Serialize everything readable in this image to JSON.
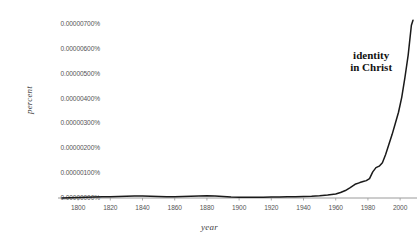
{
  "chart_data": {
    "type": "line",
    "title": "",
    "xlabel": "year",
    "ylabel": "percent",
    "xlim": [
      1790,
      2008
    ],
    "ylim": [
      0,
      7.2e-06
    ],
    "grid": false,
    "legend": null,
    "annotations": [
      {
        "text_line1": "identity",
        "text_line2": "in Christ",
        "x": 1982,
        "y": 5.6e-06
      }
    ],
    "y_tick_labels": [
      "0.00000700%",
      "0.00000600%",
      "0.00000500%",
      "0.00000400%",
      "0.00000300%",
      "0.00000200%",
      "0.00000100%",
      "0.00000000%"
    ],
    "y_tick_values": [
      7e-06,
      6e-06,
      5e-06,
      4e-06,
      3e-06,
      2e-06,
      1e-06,
      0
    ],
    "x_tick_labels": [
      "1800",
      "1820",
      "1840",
      "1860",
      "1880",
      "1900",
      "1920",
      "1940",
      "1960",
      "1980",
      "2000"
    ],
    "x_tick_values": [
      1800,
      1820,
      1840,
      1860,
      1880,
      1900,
      1920,
      1940,
      1960,
      1980,
      2000
    ],
    "series": [
      {
        "name": "identity in Christ",
        "color": "#1a1a1a",
        "x": [
          1790,
          1795,
          1800,
          1805,
          1810,
          1815,
          1820,
          1825,
          1830,
          1835,
          1840,
          1845,
          1850,
          1855,
          1860,
          1865,
          1870,
          1875,
          1880,
          1885,
          1890,
          1895,
          1900,
          1905,
          1910,
          1915,
          1920,
          1925,
          1930,
          1935,
          1940,
          1945,
          1950,
          1955,
          1960,
          1963,
          1966,
          1969,
          1972,
          1975,
          1977,
          1979,
          1981,
          1983,
          1985,
          1987,
          1989,
          1991,
          1993,
          1995,
          1997,
          1999,
          2001,
          2003,
          2005,
          2006,
          2007,
          2008
        ],
        "y": [
          0.0,
          1e-08,
          2e-08,
          3e-08,
          4e-08,
          5e-08,
          5e-08,
          6e-08,
          7e-08,
          8e-08,
          8e-08,
          7e-08,
          6e-08,
          5e-08,
          5e-08,
          6e-08,
          7e-08,
          8e-08,
          9e-08,
          8e-08,
          6e-08,
          4e-08,
          3e-08,
          3e-08,
          3e-08,
          3e-08,
          4e-08,
          4e-08,
          5e-08,
          5e-08,
          6e-08,
          7e-08,
          9e-08,
          1.2e-07,
          1.6e-07,
          2.2e-07,
          3e-07,
          4.2e-07,
          5.5e-07,
          6.2e-07,
          6.6e-07,
          7e-07,
          7.8e-07,
          1.05e-06,
          1.22e-06,
          1.28e-06,
          1.42e-06,
          1.75e-06,
          2.15e-06,
          2.55e-06,
          3e-06,
          3.45e-06,
          4.05e-06,
          4.85e-06,
          5.75e-06,
          6.35e-06,
          6.95e-06,
          7.15e-06
        ]
      }
    ]
  }
}
